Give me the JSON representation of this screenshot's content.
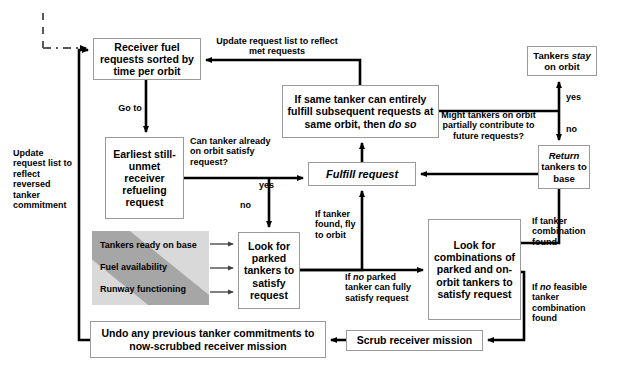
{
  "diagram": {
    "colors": {
      "node_border": "#9a9a9a",
      "node_fill": "#ffffff",
      "arrow": "#000000",
      "panel_light_gray": "#d9d9d9",
      "panel_dark_gray": "#a6a6a6"
    },
    "nodes": [
      {
        "id": "receiver-requests",
        "label": "Receiver fuel requests sorted by time per orbit",
        "x": 93,
        "y": 38,
        "w": 108,
        "h": 42,
        "font": 10.5
      },
      {
        "id": "earliest-request",
        "label": "Earliest still-unmet receiver refueling request",
        "x": 105,
        "y": 137,
        "w": 79,
        "h": 82,
        "font": 10.5
      },
      {
        "id": "look-parked",
        "label": "Look for parked tankers to satisfy request",
        "x": 238,
        "y": 232,
        "w": 62,
        "h": 77,
        "font": 10.5
      },
      {
        "id": "undo-commitments",
        "label": "Undo any previous tanker commitments to now-scrubbed receiver mission",
        "x": 90,
        "y": 321,
        "w": 236,
        "h": 37,
        "font": 10.5
      },
      {
        "id": "same-tanker",
        "label": "If same tanker can entirely fulfill subsequent requests at same orbit, then do so",
        "x": 282,
        "y": 85,
        "w": 157,
        "h": 53,
        "font": 10.5,
        "italic_tail": "do so"
      },
      {
        "id": "fulfill-request",
        "label": "Fulfill request",
        "x": 308,
        "y": 162,
        "w": 108,
        "h": 24,
        "font": 11,
        "italic": true
      },
      {
        "id": "look-combinations",
        "label": "Look for combinations of parked and on-orbit tankers to satisfy request",
        "x": 428,
        "y": 219,
        "w": 93,
        "h": 101,
        "font": 10.5
      },
      {
        "id": "scrub-mission",
        "label": "Scrub receiver mission",
        "x": 346,
        "y": 330,
        "w": 137,
        "h": 21,
        "font": 10.5
      },
      {
        "id": "tankers-stay",
        "label": "Tankers stay on orbit",
        "x": 527,
        "y": 46,
        "w": 70,
        "h": 30,
        "font": 9.5,
        "italic_word": "stay"
      },
      {
        "id": "return-tankers",
        "label": "Return tankers to base",
        "x": 538,
        "y": 145,
        "w": 52,
        "h": 44,
        "font": 9.5,
        "italic_first": "Return"
      }
    ],
    "edge_labels": [
      {
        "id": "update-met",
        "text": "Update request list to reflect met requests",
        "x": 213,
        "y": 36,
        "w": 128,
        "align": "center",
        "font": 9
      },
      {
        "id": "go-to",
        "text": "Go to",
        "x": 110,
        "y": 103,
        "w": 40,
        "align": "center",
        "font": 9
      },
      {
        "id": "can-tanker-orbit",
        "text": "Can tanker already on orbit satisfy request?",
        "x": 190,
        "y": 136,
        "w": 82,
        "align": "left",
        "font": 9
      },
      {
        "id": "yes-orbit",
        "text": "yes",
        "x": 259,
        "y": 180,
        "w": 22,
        "align": "left",
        "font": 9
      },
      {
        "id": "no-orbit",
        "text": "no",
        "x": 240,
        "y": 200,
        "w": 20,
        "align": "left",
        "font": 9
      },
      {
        "id": "update-reversed",
        "text": "Update request list to reflect reversed tanker commitment",
        "x": 13,
        "y": 148,
        "w": 64,
        "align": "left",
        "font": 9
      },
      {
        "id": "if-tanker-found",
        "text": "If tanker found, fly to orbit",
        "x": 315,
        "y": 209,
        "w": 46,
        "align": "left",
        "font": 9
      },
      {
        "id": "if-no-parked",
        "text": "If no parked tanker can fully satisfy request",
        "x": 345,
        "y": 272,
        "w": 70,
        "align": "left",
        "font": 9,
        "italic_word": "no"
      },
      {
        "id": "might-partially",
        "text": "Might tankers on orbit partially contribute to future requests?",
        "x": 439,
        "y": 110,
        "w": 99,
        "align": "center",
        "font": 9
      },
      {
        "id": "yes-partial",
        "text": "yes",
        "x": 566,
        "y": 92,
        "w": 22,
        "align": "left",
        "font": 9
      },
      {
        "id": "no-partial",
        "text": "no",
        "x": 566,
        "y": 124,
        "w": 20,
        "align": "left",
        "font": 9
      },
      {
        "id": "if-tanker-combo-found",
        "text": "If tanker combination found",
        "x": 532,
        "y": 216,
        "w": 60,
        "align": "left",
        "font": 9
      },
      {
        "id": "if-no-feasible",
        "text": "If no feasible tanker combination found",
        "x": 532,
        "y": 282,
        "w": 62,
        "align": "left",
        "font": 9,
        "italic_word": "no"
      }
    ],
    "gray_panel": {
      "id": "base-readiness-panel",
      "x": 92,
      "y": 231,
      "w": 117,
      "h": 74,
      "items": [
        "Tankers ready on base",
        "Fuel availability",
        "Runway functioning"
      ],
      "font": 9
    }
  }
}
